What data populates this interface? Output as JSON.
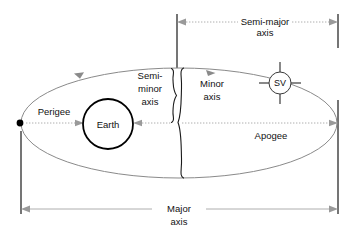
{
  "diagram": {
    "labels": {
      "semi_major_line1": "Semi-major",
      "semi_major_line2": "axis",
      "semi_minor_line1": "Semi-",
      "semi_minor_line2": "minor",
      "semi_minor_line3": "axis",
      "minor_line1": "Minor",
      "minor_line2": "axis",
      "major_line1": "Major",
      "major_line2": "axis",
      "perigee": "Perigee",
      "apogee": "Apogee",
      "earth": "Earth",
      "sv": "SV"
    },
    "colors": {
      "background": "#ffffff",
      "orbit": "#8a8a8a",
      "earth_outline": "#000000",
      "dimension": "#9a9a9a",
      "extension": "#2b2b2b",
      "text": "#111111",
      "focus": "#000000"
    },
    "geometry": {
      "ellipse_center_x": 179,
      "ellipse_center_y": 123,
      "ellipse_rx": 158,
      "ellipse_ry": 55,
      "focus_x": 20,
      "focus_y": 123,
      "earth_center_x": 108,
      "earth_center_y": 124,
      "earth_radius": 25,
      "sv_center_x": 280,
      "sv_center_y": 83,
      "sv_radius": 11,
      "left_extension_x": 21,
      "center_extension_x": 177,
      "right_extension_x": 338,
      "major_axis_dim_y": 209,
      "semi_major_dim_y": 22
    },
    "elements": {
      "orbit_path": "elliptical-orbit",
      "direction_arrows": 2,
      "focus_marker": "earth-focus-point",
      "braces": [
        "semi-minor-brace",
        "minor-axis-brace"
      ]
    }
  }
}
